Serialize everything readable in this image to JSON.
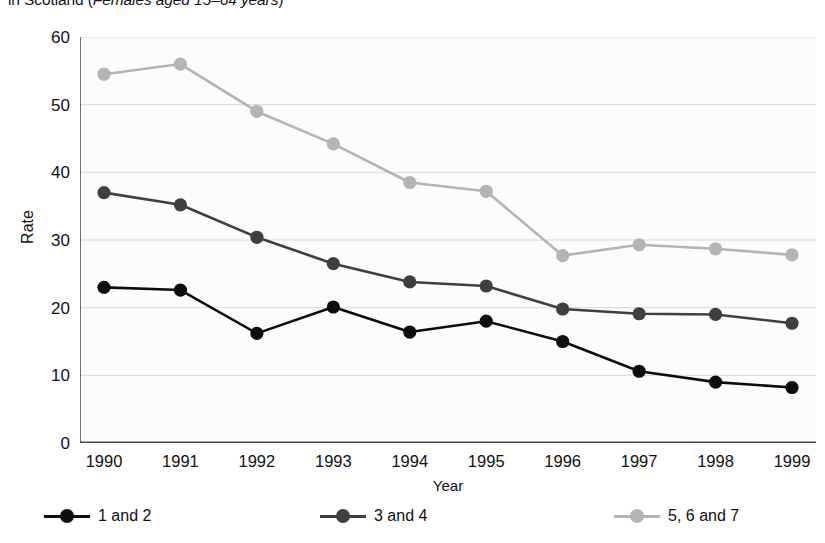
{
  "chart_data": {
    "type": "line",
    "title": "in Scotland (Females aged 15–64 years)",
    "title_prefix": "in Scotland (",
    "title_subject": "Females aged 15–64 years",
    "title_suffix": ")",
    "xlabel": "Year",
    "ylabel": "Rate",
    "x": [
      1990,
      1991,
      1992,
      1993,
      1994,
      1995,
      1996,
      1997,
      1998,
      1999
    ],
    "categories": [
      "1990",
      "1991",
      "1992",
      "1993",
      "1994",
      "1995",
      "1996",
      "1997",
      "1998",
      "1999"
    ],
    "xlim": [
      1990,
      1999
    ],
    "ylim": [
      0,
      60
    ],
    "yticks": [
      0,
      10,
      20,
      30,
      40,
      50,
      60
    ],
    "ytick_labels": [
      "0",
      "10",
      "20",
      "30",
      "40",
      "50",
      "60"
    ],
    "grid": "horizontal",
    "legend_position": "bottom",
    "series": [
      {
        "name": "1 and 2",
        "color": "#0d0d0d",
        "values": [
          23.0,
          22.6,
          16.2,
          20.1,
          16.4,
          18.0,
          15.0,
          10.6,
          9.0,
          8.2
        ]
      },
      {
        "name": "3 and 4",
        "color": "#3f3f3f",
        "values": [
          37.0,
          35.2,
          30.4,
          26.5,
          23.8,
          23.2,
          19.8,
          19.1,
          19.0,
          17.7
        ]
      },
      {
        "name": "5, 6 and 7",
        "color": "#b4b4b4",
        "values": [
          54.5,
          56.0,
          49.0,
          44.2,
          38.5,
          37.2,
          27.7,
          29.3,
          28.7,
          27.8
        ]
      }
    ]
  },
  "axes": {
    "grid_color": "#d8d8d8",
    "axis_color": "#4a4a4a",
    "plot_background": "#fcfcfc"
  },
  "legend": {
    "entries": [
      "1 and 2",
      "3 and 4",
      "5, 6 and 7"
    ]
  }
}
